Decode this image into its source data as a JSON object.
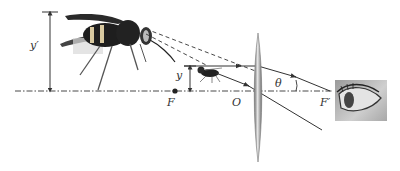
{
  "diagram": {
    "labels": {
      "image_height": "y′",
      "object_height": "y",
      "focal_point_front": "F",
      "optical_center": "O",
      "focal_point_back": "F′",
      "angle": "θ"
    },
    "elements": {
      "optical_axis": "dash-dot line",
      "lens": "biconvex lens",
      "object": "small fly (real object)",
      "virtual_image": "large wasp (magnified virtual image)",
      "observer": "eye"
    },
    "colors": {
      "line": "#333333",
      "lens_edge": "#6e6e6e",
      "lens_fill": "#b8b8b8",
      "insect": "#1a1a1a"
    }
  }
}
